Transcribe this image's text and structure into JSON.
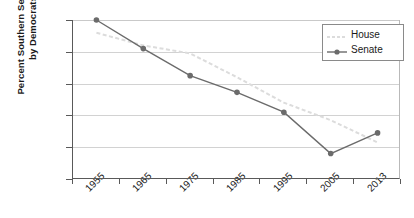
{
  "chart_data": {
    "type": "line",
    "title": "",
    "xlabel": "",
    "ylabel": "Percent Southern Seats Held\nby Democrats",
    "categories": [
      "1955",
      "1965",
      "1975",
      "1985",
      "1995",
      "2005",
      "2013"
    ],
    "yticks": [
      "0",
      "20",
      "40",
      "60",
      "80",
      "100"
    ],
    "ylim": [
      0,
      100
    ],
    "grid": true,
    "legend_position": "top-right",
    "series": [
      {
        "name": "House",
        "color": "#dcdcdc",
        "style": "dashed",
        "marker": "none",
        "values": [
          92,
          84,
          79,
          64,
          48,
          37,
          23
        ]
      },
      {
        "name": "Senate",
        "color": "#6b6b6b",
        "style": "solid",
        "marker": "circle",
        "values": [
          100,
          82,
          65,
          54.5,
          42,
          16,
          29
        ]
      }
    ]
  }
}
